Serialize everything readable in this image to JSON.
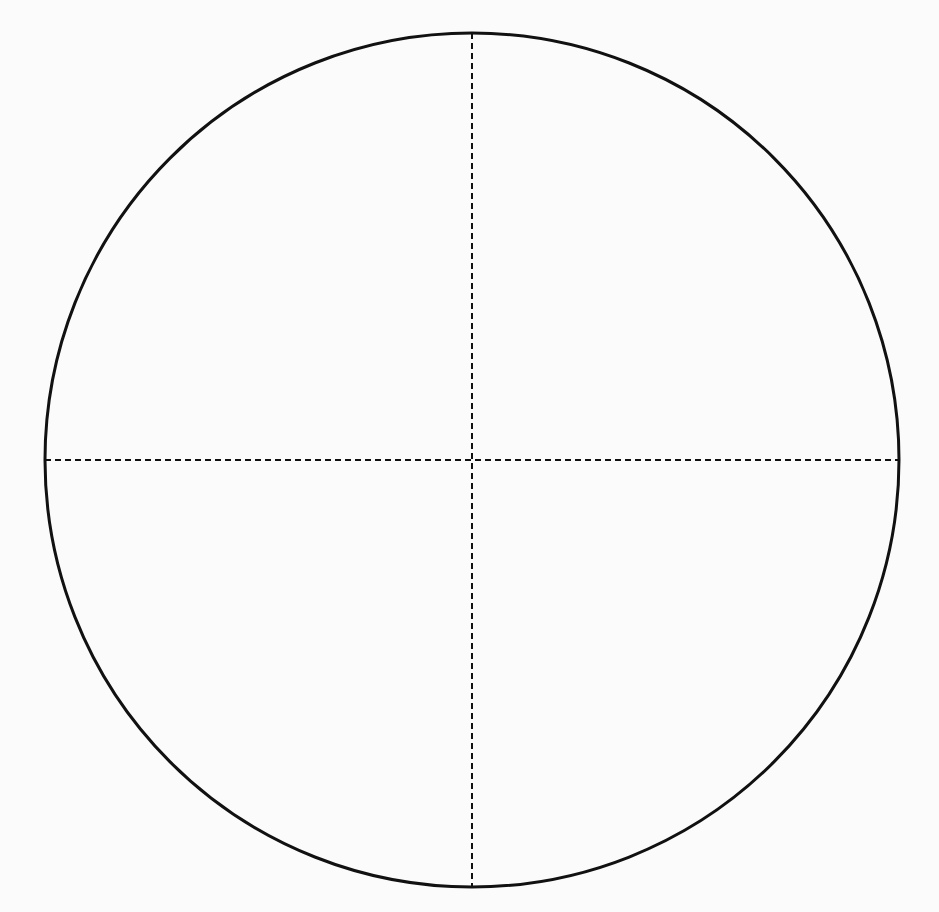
{
  "diagram": {
    "type": "circle-with-crosshair",
    "background_color": "#fbfbfb",
    "stroke_color": "#111111",
    "circle": {
      "cx": 472,
      "cy": 460,
      "r": 427,
      "stroke_width": 3
    },
    "crosshair": {
      "style": "dashed",
      "dash": [
        6,
        4
      ],
      "stroke_width": 2,
      "vertical": {
        "x": 472,
        "y1": 33,
        "y2": 887
      },
      "horizontal": {
        "y": 460,
        "x1": 45,
        "x2": 899
      }
    }
  }
}
